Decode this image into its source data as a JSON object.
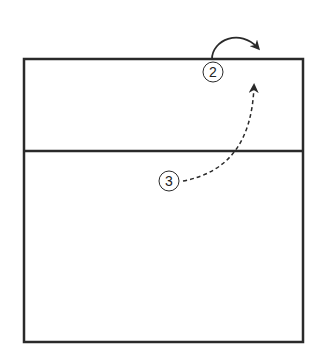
{
  "diagram": {
    "type": "volleyball-court-play",
    "players": [
      {
        "label": "2",
        "cx": 213,
        "cy": 72
      },
      {
        "label": "3",
        "cx": 169,
        "cy": 181
      }
    ],
    "court": {
      "x": 24,
      "y": 59,
      "w": 279,
      "h": 283,
      "divider_y": 151
    },
    "colors": {
      "line": "#2a2a2a",
      "background": "#ffffff"
    }
  }
}
